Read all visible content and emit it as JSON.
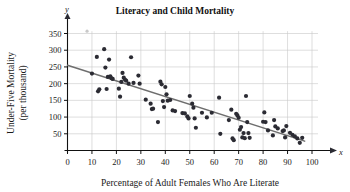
{
  "chart_data": {
    "type": "scatter",
    "title": "Literacy and Child Mortality",
    "xlabel": "Percentage of Adult Females Who Are Literate",
    "ylabel": "Under-Five Mortality (per thousand)",
    "ylabel_line1": "Under-Five Mortality",
    "ylabel_line2": "(per thousand)",
    "x_axis_symbol": "x",
    "y_axis_symbol": "y",
    "xlim": [
      0,
      100
    ],
    "ylim": [
      0,
      375
    ],
    "xticks": [
      0,
      10,
      20,
      30,
      40,
      50,
      60,
      70,
      80,
      90,
      100
    ],
    "yticks": [
      50,
      100,
      150,
      200,
      250,
      300,
      350
    ],
    "grid": true,
    "legend": "none",
    "point_color": "#2b2b33",
    "trend_color": "#6e6e6e",
    "grid_color": "#c8c8c8",
    "axis_color": "#111111",
    "trend_line": {
      "x_start": 0,
      "y_start": 255,
      "x_end": 97,
      "y_end": 28
    },
    "points": [
      [
        10,
        230
      ],
      [
        12,
        280
      ],
      [
        12.5,
        177
      ],
      [
        13,
        183
      ],
      [
        15,
        303
      ],
      [
        15.5,
        248
      ],
      [
        16,
        184
      ],
      [
        16.5,
        220
      ],
      [
        17,
        272
      ],
      [
        17.5,
        222
      ],
      [
        18,
        216
      ],
      [
        18.5,
        214
      ],
      [
        21,
        185
      ],
      [
        21.5,
        161
      ],
      [
        22,
        205
      ],
      [
        22.5,
        232
      ],
      [
        23,
        218
      ],
      [
        23.5,
        212
      ],
      [
        24,
        209
      ],
      [
        25,
        200
      ],
      [
        26,
        279
      ],
      [
        27,
        202
      ],
      [
        29,
        224
      ],
      [
        29.5,
        200
      ],
      [
        32,
        152
      ],
      [
        34,
        140
      ],
      [
        34.5,
        124
      ],
      [
        35,
        125
      ],
      [
        37,
        85
      ],
      [
        38,
        206
      ],
      [
        38.5,
        198
      ],
      [
        39,
        148
      ],
      [
        39.5,
        130
      ],
      [
        40,
        190
      ],
      [
        40.5,
        168
      ],
      [
        41,
        149
      ],
      [
        42,
        151
      ],
      [
        43,
        120
      ],
      [
        44,
        118
      ],
      [
        47,
        112
      ],
      [
        48,
        111
      ],
      [
        49,
        102
      ],
      [
        49.5,
        96
      ],
      [
        50,
        163
      ],
      [
        51,
        140
      ],
      [
        51.5,
        128
      ],
      [
        52,
        96
      ],
      [
        52.5,
        68
      ],
      [
        55,
        113
      ],
      [
        57,
        99
      ],
      [
        59,
        113
      ],
      [
        62,
        158
      ],
      [
        62.5,
        50
      ],
      [
        66,
        91
      ],
      [
        67,
        122
      ],
      [
        67.5,
        36
      ],
      [
        68,
        31
      ],
      [
        69,
        110
      ],
      [
        69.5,
        105
      ],
      [
        70,
        98
      ],
      [
        70.5,
        62
      ],
      [
        71,
        70
      ],
      [
        71.5,
        39
      ],
      [
        72,
        52
      ],
      [
        72.5,
        37
      ],
      [
        73,
        163
      ],
      [
        73.5,
        85
      ],
      [
        74,
        52
      ],
      [
        74.5,
        38
      ],
      [
        80,
        86
      ],
      [
        80.5,
        114
      ],
      [
        81,
        85
      ],
      [
        82,
        60
      ],
      [
        84,
        45
      ],
      [
        84.5,
        91
      ],
      [
        85,
        72
      ],
      [
        86,
        66
      ],
      [
        88,
        58
      ],
      [
        88.5,
        60
      ],
      [
        89,
        39
      ],
      [
        89.5,
        73
      ],
      [
        91,
        53
      ],
      [
        92,
        47
      ],
      [
        93,
        42
      ],
      [
        94,
        36
      ],
      [
        95,
        23
      ],
      [
        96,
        38
      ]
    ],
    "artifact_mark": {
      "x": 8,
      "y": 357
    }
  }
}
